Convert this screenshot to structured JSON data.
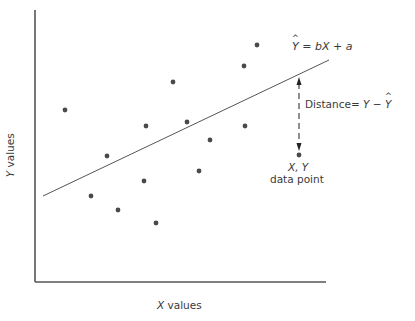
{
  "figure": {
    "equation": {
      "lhs": "Y",
      "lhs_hat": true,
      "rhs": "= bX + a",
      "text": "Ŷ = bX + a"
    },
    "distance_label": {
      "prefix": "Distance",
      "eq": "=",
      "expr_y": "Y",
      "minus": "−",
      "expr_yhat": "Y",
      "text": "Distance = Y − Ŷ"
    },
    "point_label": {
      "coords": "X, Y",
      "caption": "data point"
    },
    "x_axis_label": {
      "var": "X",
      "rest": " values"
    },
    "y_axis_label": {
      "var": "Y",
      "rest": " values"
    }
  },
  "chart_data": {
    "type": "scatter",
    "title": "",
    "xlabel": "X values",
    "ylabel": "Y values",
    "grid": false,
    "legend": "none",
    "axes": {
      "origin_px": [
        35,
        282
      ],
      "x_end_px": 326,
      "y_top_px": 10
    },
    "points_px": [
      [
        65,
        110
      ],
      [
        107,
        156
      ],
      [
        146,
        126
      ],
      [
        187,
        122
      ],
      [
        173,
        82
      ],
      [
        91,
        196
      ],
      [
        118,
        210
      ],
      [
        144,
        181
      ],
      [
        156,
        223
      ],
      [
        199,
        171
      ],
      [
        210,
        140
      ],
      [
        245,
        126
      ],
      [
        244,
        66
      ],
      [
        257,
        45
      ],
      [
        299,
        155
      ]
    ],
    "regression_line_px": {
      "start": [
        43,
        196
      ],
      "end": [
        329,
        60
      ],
      "equation": "Ŷ = bX + a"
    },
    "annotations": [
      {
        "type": "double-arrow-dashed",
        "from_px": [
          299,
          77
        ],
        "to_px": [
          299,
          151
        ],
        "label": "Distance = Y − Ŷ"
      },
      {
        "type": "point-label",
        "at_px": [
          299,
          155
        ],
        "label": "X, Y data point"
      }
    ],
    "colors": {
      "point": "#4a4a4a",
      "line": "#555555",
      "axis": "#555555",
      "text": "#3a3a3a"
    }
  }
}
